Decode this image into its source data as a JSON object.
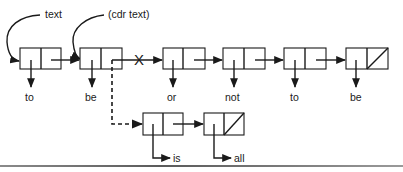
{
  "diagram": {
    "pointer_labels": {
      "text": "text",
      "cdr_text": "(cdr text)"
    },
    "main_list": {
      "cells": [
        {
          "car": "to"
        },
        {
          "car": "be"
        },
        {
          "car": "or"
        },
        {
          "car": "not"
        },
        {
          "car": "to"
        },
        {
          "car": "be",
          "cdr": "nil"
        }
      ],
      "broken_link_marker": "X"
    },
    "inserted_list": {
      "cells": [
        {
          "car": "is"
        },
        {
          "car": "all",
          "cdr": "nil"
        }
      ]
    },
    "colors": {
      "stroke": "#1a1a1a",
      "background": "#ffffff",
      "rule": "#707070"
    }
  }
}
